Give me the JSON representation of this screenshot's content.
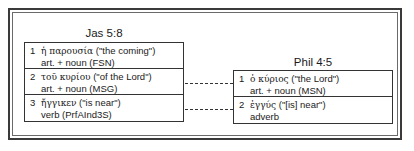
{
  "left": {
    "title": "Jas 5:8",
    "items": [
      {
        "num": "1",
        "greek": "ἡ παρουσία",
        "gloss": " (\"the coming\")",
        "parse": "art. + noun (FSN)"
      },
      {
        "num": "2",
        "greek": "τοῦ κυρίου",
        "gloss": " (\"of the Lord\")",
        "parse": "art. + noun (MSG)"
      },
      {
        "num": "3",
        "greek": "ἤγγικεν",
        "gloss": " (\"is near\")",
        "parse": "verb (PrfAInd3S)"
      }
    ]
  },
  "right": {
    "title": "Phil 4:5",
    "items": [
      {
        "num": "1",
        "greek": "ὁ κύριος",
        "gloss": " (\"the Lord\")",
        "parse": "art. + noun (MSN)"
      },
      {
        "num": "2",
        "greek": "ἐγγύς",
        "gloss": " (\"[is] near\")",
        "parse": "adverb"
      }
    ]
  },
  "links": [
    {
      "from": "left.2",
      "to": "right.1"
    },
    {
      "from": "left.3",
      "to": "right.2"
    }
  ]
}
